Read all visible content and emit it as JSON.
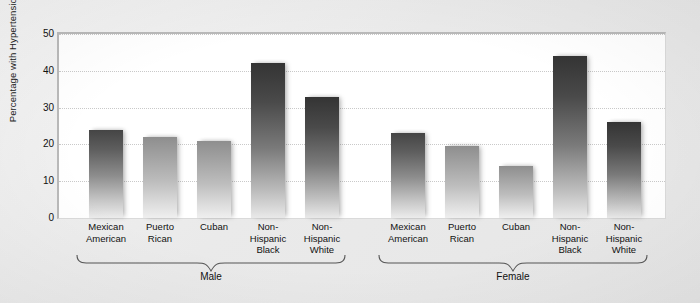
{
  "chart_data": {
    "type": "bar",
    "title": "",
    "subtitle": "",
    "xlabel": "",
    "ylabel": "Percentage with Hypertension",
    "ylim": [
      0,
      50
    ],
    "yticks": [
      0,
      10,
      20,
      30,
      40,
      50
    ],
    "grid": true,
    "legend": "none",
    "group_labels": [
      "Male",
      "Female"
    ],
    "categories": [
      "Mexican American",
      "Puerto Rican",
      "Cuban",
      "Non-Hispanic Black",
      "Non-Hispanic White"
    ],
    "series": [
      {
        "name": "Male",
        "values": [
          24,
          22,
          21,
          42,
          33
        ]
      },
      {
        "name": "Female",
        "values": [
          23,
          19.5,
          14,
          44,
          26
        ]
      }
    ],
    "bars": [
      {
        "group": "Male",
        "category": "Mexican American",
        "label_line1": "Mexican",
        "label_line2": "American",
        "value": 24,
        "shade": "mid"
      },
      {
        "group": "Male",
        "category": "Puerto Rican",
        "label_line1": "Puerto",
        "label_line2": "Rican",
        "value": 22,
        "shade": "light"
      },
      {
        "group": "Male",
        "category": "Cuban",
        "label_line1": "Cuban",
        "label_line2": "",
        "value": 21,
        "shade": "light"
      },
      {
        "group": "Male",
        "category": "Non-Hispanic Black",
        "label_line1": "Non-",
        "label_line2": "Hispanic",
        "label_line3": "Black",
        "value": 42,
        "shade": "dark"
      },
      {
        "group": "Male",
        "category": "Non-Hispanic White",
        "label_line1": "Non-",
        "label_line2": "Hispanic",
        "label_line3": "White",
        "value": 33,
        "shade": "dark"
      },
      {
        "group": "Female",
        "category": "Mexican American",
        "label_line1": "Mexican",
        "label_line2": "American",
        "value": 23,
        "shade": "mid"
      },
      {
        "group": "Female",
        "category": "Puerto Rican",
        "label_line1": "Puerto",
        "label_line2": "Rican",
        "value": 19.5,
        "shade": "light"
      },
      {
        "group": "Female",
        "category": "Cuban",
        "label_line1": "Cuban",
        "label_line2": "",
        "value": 14,
        "shade": "light"
      },
      {
        "group": "Female",
        "category": "Non-Hispanic Black",
        "label_line1": "Non-",
        "label_line2": "Hispanic",
        "label_line3": "Black",
        "value": 44,
        "shade": "dark"
      },
      {
        "group": "Female",
        "category": "Non-Hispanic White",
        "label_line1": "Non-",
        "label_line2": "Hispanic",
        "label_line3": "White",
        "value": 26,
        "shade": "dark"
      }
    ],
    "colors": {
      "bar_top": "#4a4a4a",
      "bar_bottom": "#ededed",
      "plot_background": "#ffffff",
      "figure_background": "#ececec",
      "gridline": "#c9c9c9",
      "text": "#111111"
    }
  }
}
